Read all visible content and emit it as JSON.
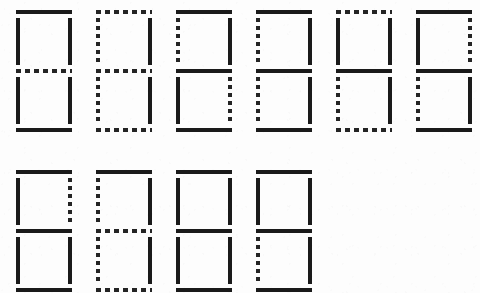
{
  "diagram": {
    "background_color": "#fdfdfd",
    "segment_on_color": "#1a1a1a",
    "segment_off_color": "#242424",
    "rows": 2,
    "columns_row1": 6,
    "columns_row2": 4,
    "segment_order": [
      "top",
      "top-left",
      "top-right",
      "middle",
      "bottom-left",
      "bottom-right",
      "bottom"
    ],
    "cell_width": 56,
    "cell_height": 122,
    "column_pitch": 80,
    "row_pitch": 160,
    "origin_x": 16,
    "origin_y": 10
  },
  "digits": [
    {
      "value": "0",
      "row": 0,
      "column": 0,
      "x": 16,
      "y": 10,
      "segments": {
        "top": "on",
        "top-left": "on",
        "top-right": "on",
        "middle": "off",
        "bottom-left": "on",
        "bottom-right": "on",
        "bottom": "on"
      }
    },
    {
      "value": "1",
      "row": 0,
      "column": 1,
      "x": 96,
      "y": 10,
      "segments": {
        "top": "off",
        "top-left": "off",
        "top-right": "on",
        "middle": "off",
        "bottom-left": "off",
        "bottom-right": "on",
        "bottom": "off"
      }
    },
    {
      "value": "2",
      "row": 0,
      "column": 2,
      "x": 176,
      "y": 10,
      "segments": {
        "top": "on",
        "top-left": "off",
        "top-right": "on",
        "middle": "on",
        "bottom-left": "on",
        "bottom-right": "off",
        "bottom": "on"
      }
    },
    {
      "value": "3",
      "row": 0,
      "column": 3,
      "x": 256,
      "y": 10,
      "segments": {
        "top": "on",
        "top-left": "off",
        "top-right": "on",
        "middle": "on",
        "bottom-left": "off",
        "bottom-right": "on",
        "bottom": "on"
      }
    },
    {
      "value": "4",
      "row": 0,
      "column": 4,
      "x": 336,
      "y": 10,
      "segments": {
        "top": "off",
        "top-left": "on",
        "top-right": "on",
        "middle": "on",
        "bottom-left": "off",
        "bottom-right": "on",
        "bottom": "off"
      }
    },
    {
      "value": "5",
      "row": 0,
      "column": 5,
      "x": 416,
      "y": 10,
      "segments": {
        "top": "on",
        "top-left": "on",
        "top-right": "off",
        "middle": "on",
        "bottom-left": "off",
        "bottom-right": "on",
        "bottom": "on"
      }
    },
    {
      "value": "6",
      "row": 1,
      "column": 0,
      "x": 16,
      "y": 170,
      "segments": {
        "top": "on",
        "top-left": "on",
        "top-right": "off",
        "middle": "on",
        "bottom-left": "on",
        "bottom-right": "on",
        "bottom": "on"
      }
    },
    {
      "value": "7",
      "row": 1,
      "column": 1,
      "x": 96,
      "y": 170,
      "segments": {
        "top": "on",
        "top-left": "off",
        "top-right": "on",
        "middle": "off",
        "bottom-left": "off",
        "bottom-right": "on",
        "bottom": "off"
      }
    },
    {
      "value": "8",
      "row": 1,
      "column": 2,
      "x": 176,
      "y": 170,
      "segments": {
        "top": "on",
        "top-left": "on",
        "top-right": "on",
        "middle": "on",
        "bottom-left": "on",
        "bottom-right": "on",
        "bottom": "on"
      }
    },
    {
      "value": "9",
      "row": 1,
      "column": 3,
      "x": 256,
      "y": 170,
      "segments": {
        "top": "on",
        "top-left": "on",
        "top-right": "on",
        "middle": "on",
        "bottom-left": "off",
        "bottom-right": "on",
        "bottom": "on"
      }
    }
  ]
}
